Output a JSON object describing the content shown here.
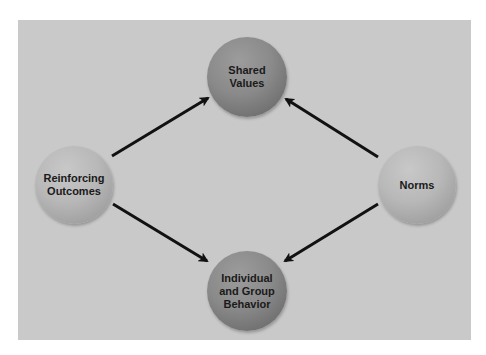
{
  "diagram": {
    "type": "flow-diagram",
    "colors": {
      "panel_background": "#c9c9c9",
      "dark_node": "#8a8a8a",
      "light_node": "#b8b8b8",
      "arrow": "#111111",
      "label": "#1a1a1a"
    },
    "nodes": [
      {
        "id": "shared-values",
        "label": "Shared\nValues",
        "tone": "dark"
      },
      {
        "id": "reinforcing-outcomes",
        "label": "Reinforcing\nOutcomes",
        "tone": "light"
      },
      {
        "id": "norms",
        "label": "Norms",
        "tone": "light"
      },
      {
        "id": "individual-group-behavior",
        "label": "Individual\nand Group\nBehavior",
        "tone": "dark"
      }
    ],
    "edges": [
      {
        "from": "reinforcing-outcomes",
        "to": "shared-values"
      },
      {
        "from": "norms",
        "to": "shared-values"
      },
      {
        "from": "reinforcing-outcomes",
        "to": "individual-group-behavior"
      },
      {
        "from": "norms",
        "to": "individual-group-behavior"
      }
    ]
  }
}
